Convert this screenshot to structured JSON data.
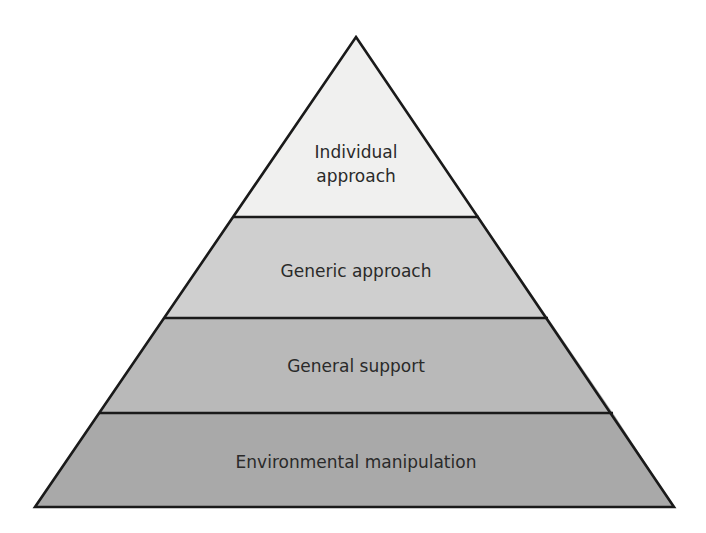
{
  "diagram": {
    "type": "pyramid",
    "tiers_top_to_bottom": [
      {
        "id": "individual",
        "label_lines": [
          "Individual",
          "approach"
        ],
        "fill": "#f0f0ef"
      },
      {
        "id": "generic",
        "label_lines": [
          "Generic approach"
        ],
        "fill": "#cfcfcf"
      },
      {
        "id": "general",
        "label_lines": [
          "General support"
        ],
        "fill": "#b9b9b9"
      },
      {
        "id": "environmental",
        "label_lines": [
          "Environmental manipulation"
        ],
        "fill": "#a9a9a9"
      }
    ],
    "outline_color": "#1a1a1a"
  }
}
